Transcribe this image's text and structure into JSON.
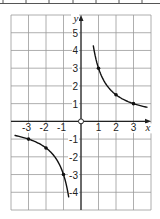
{
  "chart_data": {
    "type": "line",
    "title": "",
    "function": "y = 3/x",
    "xlabel": "x",
    "ylabel": "y",
    "xlim": [
      -4,
      4
    ],
    "ylim": [
      -5,
      6
    ],
    "grid": true,
    "x_ticks": [
      "-3",
      "-2",
      "-1",
      "1",
      "2",
      "3"
    ],
    "y_ticks": [
      "5",
      "4",
      "3",
      "2",
      "1",
      "-1",
      "-2",
      "-3",
      "-4"
    ],
    "origin_label": "O",
    "series": [
      {
        "name": "positive branch",
        "x": [
          0.7,
          1,
          2,
          3,
          3.8
        ],
        "y": [
          4.29,
          3,
          1.5,
          1,
          0.79
        ],
        "marked_points": [
          [
            1,
            3
          ],
          [
            2,
            1.5
          ],
          [
            3,
            1
          ]
        ]
      },
      {
        "name": "negative branch",
        "x": [
          -3.8,
          -3,
          -2,
          -1,
          -0.7
        ],
        "y": [
          -0.79,
          -1,
          -1.5,
          -3,
          -4.29
        ],
        "marked_points": [
          [
            -3,
            -1
          ],
          [
            -2,
            -1.5
          ],
          [
            -1,
            -3
          ]
        ]
      }
    ]
  }
}
